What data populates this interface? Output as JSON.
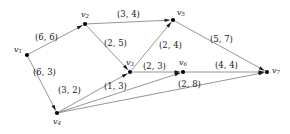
{
  "figure": {
    "type": "directed-graph",
    "background_color": "#ffffff",
    "edge_color": "#8a8a8a",
    "node_color": "#000000",
    "label_color": "#1a1a1a"
  },
  "chart_data": {
    "type": "diagram",
    "title": "",
    "nodes": [
      {
        "id": "v1",
        "name": "v",
        "subscript": "1",
        "x": 27,
        "y": 55,
        "label_dx": -13,
        "label_dy": -9
      },
      {
        "id": "v2",
        "name": "v",
        "subscript": "2",
        "x": 85,
        "y": 24,
        "label_dx": -4,
        "label_dy": -13
      },
      {
        "id": "v3",
        "name": "v",
        "subscript": "3",
        "x": 130,
        "y": 72,
        "label_dx": -4,
        "label_dy": -13
      },
      {
        "id": "v4",
        "name": "v",
        "subscript": "4",
        "x": 57,
        "y": 113,
        "label_dx": -4,
        "label_dy": 5
      },
      {
        "id": "v5",
        "name": "v",
        "subscript": "5",
        "x": 173,
        "y": 20,
        "label_dx": 4,
        "label_dy": -11
      },
      {
        "id": "v6",
        "name": "v",
        "subscript": "6",
        "x": 183,
        "y": 72,
        "label_dx": -4,
        "label_dy": -13
      },
      {
        "id": "v7",
        "name": "v",
        "subscript": "7",
        "x": 267,
        "y": 72,
        "label_dx": 5,
        "label_dy": -5
      }
    ],
    "edges": [
      {
        "id": "e1",
        "from": "v1",
        "to": "v2",
        "label": "(6, 6)",
        "capacity": 6,
        "flow": 6,
        "label_x": 35,
        "label_y": 33
      },
      {
        "id": "e2",
        "from": "v1",
        "to": "v4",
        "label": "(6, 3)",
        "capacity": 6,
        "flow": 3,
        "label_x": 33,
        "label_y": 68
      },
      {
        "id": "e3",
        "from": "v2",
        "to": "v5",
        "label": "(3, 4)",
        "capacity": 3,
        "flow": 4,
        "label_x": 117,
        "label_y": 10
      },
      {
        "id": "e4",
        "from": "v2",
        "to": "v3",
        "label": "(2, 5)",
        "capacity": 2,
        "flow": 5,
        "label_x": 104,
        "label_y": 39
      },
      {
        "id": "e5",
        "from": "v3",
        "to": "v5",
        "label": "(2, 4)",
        "capacity": 2,
        "flow": 4,
        "label_x": 159,
        "label_y": 41
      },
      {
        "id": "e6",
        "from": "v3",
        "to": "v6",
        "label": "(2, 3)",
        "capacity": 2,
        "flow": 3,
        "label_x": 143,
        "label_y": 62
      },
      {
        "id": "e7",
        "from": "v4",
        "to": "v3",
        "label": "(1, 3)",
        "capacity": 1,
        "flow": 3,
        "label_x": 104,
        "label_y": 82
      },
      {
        "id": "e8",
        "from": "v4",
        "to": "v6",
        "label": "(2, 8)",
        "capacity": 2,
        "flow": 8,
        "label_x": 178,
        "label_y": 80
      },
      {
        "id": "e9",
        "from": "v4",
        "to": "v7",
        "label": "(3, 2)",
        "capacity": 3,
        "flow": 2,
        "label_x": 58,
        "label_y": 86
      },
      {
        "id": "e10",
        "from": "v5",
        "to": "v7",
        "label": "(5, 7)",
        "capacity": 5,
        "flow": 7,
        "label_x": 210,
        "label_y": 35
      },
      {
        "id": "e11",
        "from": "v6",
        "to": "v7",
        "label": "(4, 4)",
        "capacity": 4,
        "flow": 4,
        "label_x": 215,
        "label_y": 61
      }
    ],
    "legend": [],
    "xlabel": "",
    "ylabel": ""
  }
}
